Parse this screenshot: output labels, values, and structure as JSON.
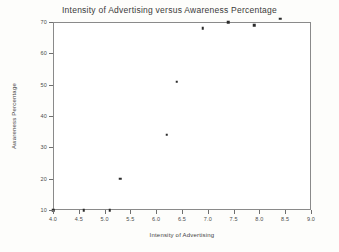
{
  "chart_data": {
    "type": "scatter",
    "title": "Intensity of Advertising versus Awareness Percentage",
    "xlabel": "Intensity of Advertising",
    "ylabel": "Awareness Percentage",
    "xlim": [
      4.0,
      9.0
    ],
    "ylim": [
      10,
      70
    ],
    "grid": false,
    "legend": null,
    "xticks": [
      "4.0",
      "4.5",
      "5.0",
      "5.5",
      "6.0",
      "6.5",
      "7.0",
      "7.5",
      "8.0",
      "8.5",
      "9.0"
    ],
    "xtick_values": [
      4.0,
      4.5,
      5.0,
      5.5,
      6.0,
      6.5,
      7.0,
      7.5,
      8.0,
      8.5,
      9.0
    ],
    "yticks": [
      "10",
      "20",
      "30",
      "40",
      "50",
      "60",
      "70"
    ],
    "ytick_values": [
      10,
      20,
      30,
      40,
      50,
      60,
      70
    ],
    "marker": "square",
    "marker_color": "#2b2b2b",
    "points": [
      {
        "x": 4.0,
        "y": 10
      },
      {
        "x": 4.6,
        "y": 10
      },
      {
        "x": 5.1,
        "y": 10
      },
      {
        "x": 5.3,
        "y": 20
      },
      {
        "x": 6.2,
        "y": 34
      },
      {
        "x": 6.4,
        "y": 51
      },
      {
        "x": 6.9,
        "y": 68
      },
      {
        "x": 7.4,
        "y": 70
      },
      {
        "x": 7.9,
        "y": 69
      },
      {
        "x": 8.4,
        "y": 71
      }
    ]
  },
  "colors": {
    "frame": "#8a8a8a",
    "text": "#3a3a3a",
    "marker": "#2b2b2b",
    "background": "#ffffff"
  }
}
